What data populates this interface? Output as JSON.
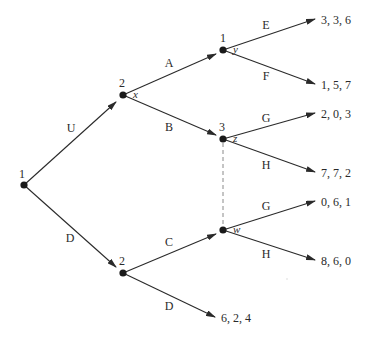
{
  "diagram": {
    "type": "extensive-form game tree",
    "width": 368,
    "height": 339,
    "colors": {
      "line": "#2a2a2a",
      "node": "#1a1a1a",
      "information_set": "#8a8a8a",
      "background": "#ffffff"
    },
    "nodes": [
      {
        "id": "root",
        "player": "1",
        "var": "",
        "x": 24,
        "y": 185,
        "player_dx": -5,
        "player_dy": -7
      },
      {
        "id": "x",
        "player": "2",
        "var": "x",
        "x": 123,
        "y": 95,
        "player_dx": -4,
        "player_dy": -8
      },
      {
        "id": "d2",
        "player": "2",
        "var": "",
        "x": 123,
        "y": 273,
        "player_dx": -4,
        "player_dy": -8
      },
      {
        "id": "y",
        "player": "1",
        "var": "y",
        "x": 223,
        "y": 50,
        "player_dx": -3,
        "player_dy": -8
      },
      {
        "id": "z",
        "player": "3",
        "var": "z",
        "x": 223,
        "y": 139,
        "player_dx": -4,
        "player_dy": -8
      },
      {
        "id": "w",
        "player": "",
        "var": "w",
        "x": 223,
        "y": 230,
        "player_dx": 0,
        "player_dy": 0
      }
    ],
    "edges": [
      {
        "from": "root",
        "to_x": 116,
        "to_y": 102,
        "label": "U",
        "lx": 71,
        "ly": 132
      },
      {
        "from": "root",
        "to_x": 116,
        "to_y": 267,
        "label": "D",
        "lx": 70,
        "ly": 242
      },
      {
        "from": "x",
        "to_x": 216,
        "to_y": 54,
        "label": "A",
        "lx": 169,
        "ly": 67
      },
      {
        "from": "x",
        "to_x": 216,
        "to_y": 135,
        "label": "B",
        "lx": 169,
        "ly": 131
      },
      {
        "from": "d2",
        "to_x": 216,
        "to_y": 234,
        "label": "C",
        "lx": 169,
        "ly": 246
      },
      {
        "from": "d2",
        "to_x": 215,
        "to_y": 317,
        "label": "D",
        "lx": 169,
        "ly": 310
      },
      {
        "from": "y",
        "to_x": 315,
        "to_y": 19,
        "label": "E",
        "lx": 266,
        "ly": 29
      },
      {
        "from": "y",
        "to_x": 315,
        "to_y": 84,
        "label": "F",
        "lx": 266,
        "ly": 80
      },
      {
        "from": "z",
        "to_x": 315,
        "to_y": 113,
        "label": "G",
        "lx": 266,
        "ly": 122
      },
      {
        "from": "z",
        "to_x": 315,
        "to_y": 172,
        "label": "H",
        "lx": 266,
        "ly": 169
      },
      {
        "from": "w",
        "to_x": 315,
        "to_y": 201,
        "label": "G",
        "lx": 266,
        "ly": 210
      },
      {
        "from": "w",
        "to_x": 315,
        "to_y": 260,
        "label": "H",
        "lx": 266,
        "ly": 258
      }
    ],
    "payoffs": [
      {
        "text": "3, 3, 6",
        "x": 321,
        "y": 24
      },
      {
        "text": "1, 5, 7",
        "x": 321,
        "y": 89
      },
      {
        "text": "2, 0, 3",
        "x": 321,
        "y": 118
      },
      {
        "text": "7, 7, 2",
        "x": 321,
        "y": 177
      },
      {
        "text": "0, 6, 1",
        "x": 321,
        "y": 206
      },
      {
        "text": "8, 6, 0",
        "x": 321,
        "y": 265
      },
      {
        "text": "6, 2, 4",
        "x": 221,
        "y": 322
      }
    ],
    "information_sets": [
      {
        "nodes": [
          "z",
          "w"
        ],
        "x1": 223,
        "y1": 143,
        "x2": 223,
        "y2": 226,
        "style": "dashed"
      }
    ]
  }
}
